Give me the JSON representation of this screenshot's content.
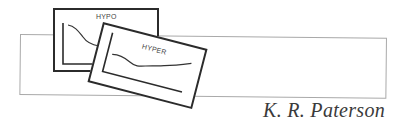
{
  "illustration": {
    "background_box_color": "#a9a9a9",
    "card_border_color": "#2b2b2b",
    "cards": [
      {
        "id": "hypo",
        "label": "HYPO",
        "curve_shape": "descending-then-flat"
      },
      {
        "id": "hyper",
        "label": "HYPER",
        "curve_shape": "wavy-flat"
      }
    ]
  },
  "author": {
    "name": "K. R. Paterson"
  }
}
